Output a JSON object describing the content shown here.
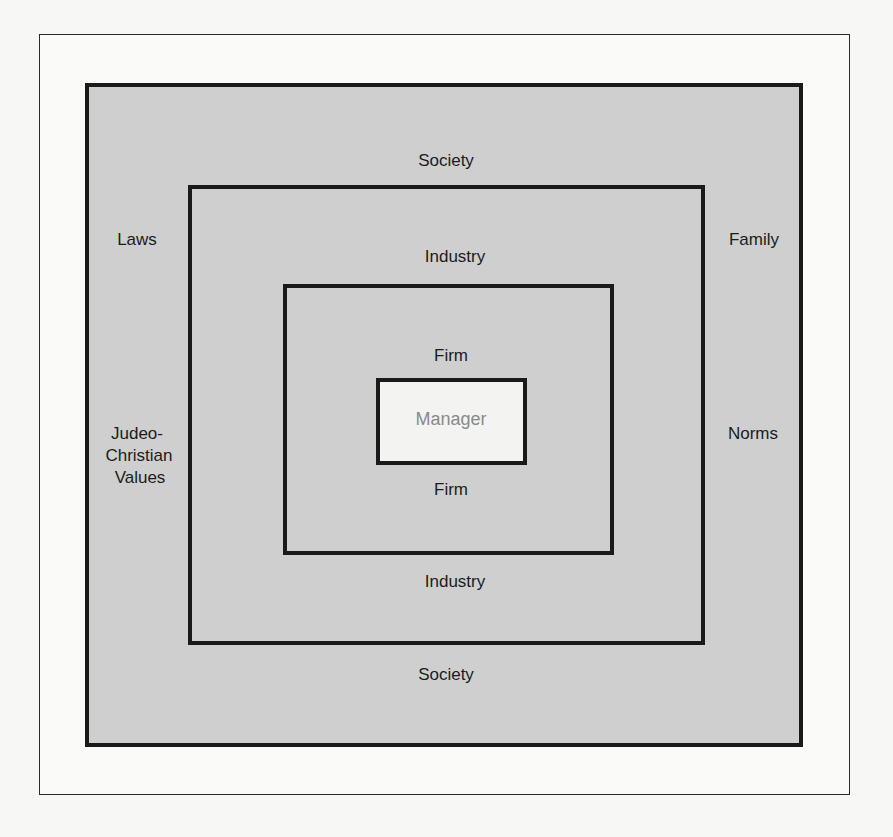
{
  "diagram": {
    "type": "nested-boxes",
    "levels": [
      {
        "name": "Society",
        "top_label": "Society",
        "bottom_label": "Society"
      },
      {
        "name": "Industry",
        "top_label": "Industry",
        "bottom_label": "Industry"
      },
      {
        "name": "Firm",
        "top_label": "Firm",
        "bottom_label": "Firm"
      },
      {
        "name": "Manager",
        "label": "Manager"
      }
    ],
    "left_labels": [
      "Laws",
      "Judeo-",
      "Christian",
      "Values"
    ],
    "right_labels": [
      "Family",
      "Norms"
    ],
    "colors": {
      "fill": "#cfcfcf",
      "border": "#1a1a1a",
      "manager_fill": "#f3f3f1",
      "manager_text": "#8a8a8a"
    }
  }
}
